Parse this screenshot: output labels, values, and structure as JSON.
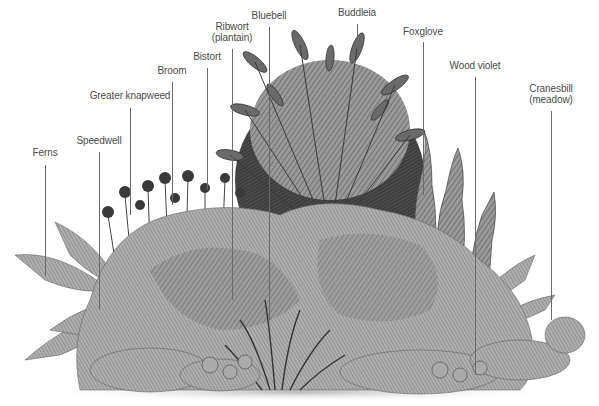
{
  "figure": {
    "type": "labelled botanical illustration",
    "palette": {
      "ink": "#3a3a3a",
      "mid": "#7a7a7a",
      "light": "#b8b8b8",
      "label_text": "#4a4a4a",
      "leader_line": "#6a6a6a",
      "background": "#ffffff"
    },
    "labels": [
      {
        "id": "ferns",
        "lines": [
          "Ferns"
        ],
        "x": 45,
        "text_top": 147,
        "line_top": 165,
        "line_bottom": 276
      },
      {
        "id": "speedwell",
        "lines": [
          "Speedwell"
        ],
        "x": 99,
        "text_top": 135,
        "line_top": 152,
        "line_bottom": 310
      },
      {
        "id": "greater-knapweed",
        "lines": [
          "Greater knapweed"
        ],
        "x": 130,
        "text_top": 90,
        "line_top": 108,
        "line_bottom": 215
      },
      {
        "id": "broom",
        "lines": [
          "Broom"
        ],
        "x": 172,
        "text_top": 65,
        "line_top": 82,
        "line_bottom": 205
      },
      {
        "id": "bistort",
        "lines": [
          "Bistort"
        ],
        "x": 207,
        "text_top": 51,
        "line_top": 68,
        "line_bottom": 190
      },
      {
        "id": "ribwort-plantain",
        "lines": [
          "Ribwort",
          "(plantain)"
        ],
        "x": 232,
        "text_top": 21,
        "line_top": 49,
        "line_bottom": 300
      },
      {
        "id": "bluebell",
        "lines": [
          "Bluebell"
        ],
        "x": 269,
        "text_top": 10,
        "line_top": 27,
        "line_bottom": 320
      },
      {
        "id": "buddleia",
        "lines": [
          "Buddleia"
        ],
        "x": 357,
        "text_top": 7,
        "line_top": 24,
        "line_bottom": 50
      },
      {
        "id": "foxglove",
        "lines": [
          "Foxglove"
        ],
        "x": 423,
        "text_top": 26,
        "line_top": 42,
        "line_bottom": 195
      },
      {
        "id": "wood-violet",
        "lines": [
          "Wood violet"
        ],
        "x": 475,
        "text_top": 60,
        "line_top": 77,
        "line_bottom": 375
      },
      {
        "id": "cranesbill-meadow",
        "lines": [
          "Cranesbill",
          "(meadow)"
        ],
        "x": 551,
        "text_top": 83,
        "line_top": 111,
        "line_bottom": 320
      }
    ]
  }
}
